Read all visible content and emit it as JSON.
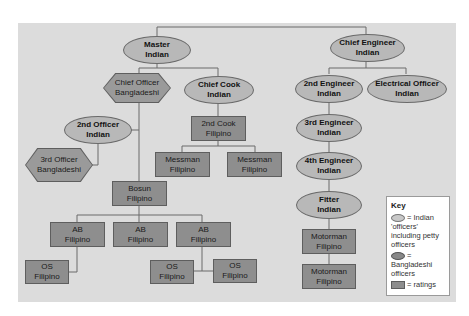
{
  "diagram": {
    "type": "organization-chart",
    "nodes": {
      "master": {
        "role": "Master",
        "nationality": "Indian",
        "shape": "oval"
      },
      "chief_engineer": {
        "role": "Chief Engineer",
        "nationality": "Indian",
        "shape": "oval"
      },
      "chief_officer": {
        "role": "Chief Officer",
        "nationality": "Bangladeshi",
        "shape": "hexagon"
      },
      "chief_cook": {
        "role": "Chief Cook",
        "nationality": "Indian",
        "shape": "oval"
      },
      "second_officer": {
        "role": "2nd  Officer",
        "nationality": "Indian",
        "shape": "oval"
      },
      "third_officer": {
        "role": "3rd Officer",
        "nationality": "Bangladeshi",
        "shape": "hexagon"
      },
      "second_cook": {
        "role": "2nd Cook",
        "nationality": "Filipino",
        "shape": "rect"
      },
      "messman_1": {
        "role": "Messman",
        "nationality": "Filipino",
        "shape": "rect"
      },
      "messman_2": {
        "role": "Messman",
        "nationality": "Filipino",
        "shape": "rect"
      },
      "bosun": {
        "role": "Bosun",
        "nationality": "Filipino",
        "shape": "rect"
      },
      "ab_1": {
        "role": "AB",
        "nationality": "Filipino",
        "shape": "rect"
      },
      "ab_2": {
        "role": "AB",
        "nationality": "Filipino",
        "shape": "rect"
      },
      "ab_3": {
        "role": "AB",
        "nationality": "Filipino",
        "shape": "rect"
      },
      "os_1": {
        "role": "OS",
        "nationality": "Filipino",
        "shape": "rect"
      },
      "os_2": {
        "role": "OS",
        "nationality": "Filipino",
        "shape": "rect"
      },
      "os_3": {
        "role": "OS",
        "nationality": "Filipino",
        "shape": "rect"
      },
      "second_engineer": {
        "role": "2nd  Engineer",
        "nationality": "Indian",
        "shape": "oval"
      },
      "electrical_officer": {
        "role": "Electrical Officer",
        "nationality": "Indian",
        "shape": "oval"
      },
      "third_engineer": {
        "role": "3rd  Engineer",
        "nationality": "Indian",
        "shape": "oval"
      },
      "fourth_engineer": {
        "role": "4th  Engineer",
        "nationality": "Indian",
        "shape": "oval"
      },
      "fitter": {
        "role": "Fitter",
        "nationality": "Indian",
        "shape": "oval"
      },
      "motorman_1": {
        "role": "Motorman",
        "nationality": "Filipino",
        "shape": "rect"
      },
      "motorman_2": {
        "role": "Motorman",
        "nationality": "Filipino",
        "shape": "rect"
      }
    },
    "edges": [
      [
        "master",
        "chief_engineer"
      ],
      [
        "master",
        "chief_officer"
      ],
      [
        "master",
        "chief_cook"
      ],
      [
        "chief_officer",
        "second_officer"
      ],
      [
        "second_officer",
        "third_officer"
      ],
      [
        "chief_officer",
        "bosun"
      ],
      [
        "chief_cook",
        "second_cook"
      ],
      [
        "second_cook",
        "messman_1"
      ],
      [
        "second_cook",
        "messman_2"
      ],
      [
        "bosun",
        "ab_1"
      ],
      [
        "bosun",
        "ab_2"
      ],
      [
        "bosun",
        "ab_3"
      ],
      [
        "ab_1",
        "os_1"
      ],
      [
        "ab_3",
        "os_2"
      ],
      [
        "ab_3",
        "os_3"
      ],
      [
        "chief_engineer",
        "second_engineer"
      ],
      [
        "chief_engineer",
        "electrical_officer"
      ],
      [
        "second_engineer",
        "third_engineer"
      ],
      [
        "third_engineer",
        "fourth_engineer"
      ],
      [
        "fourth_engineer",
        "fitter"
      ],
      [
        "fitter",
        "motorman_1"
      ],
      [
        "motorman_1",
        "motorman_2"
      ]
    ]
  },
  "key": {
    "title": "Key",
    "items": [
      {
        "symbol": "light-oval",
        "label": "= Indian 'officers' including petty officers"
      },
      {
        "symbol": "dark-oval",
        "label": "= Bangladeshi officers"
      },
      {
        "symbol": "rect",
        "label": "= ratings"
      }
    ]
  },
  "colors": {
    "background": "#dcdcdc",
    "oval_fill": "#b8b8b8",
    "rect_fill": "#8e8e8e",
    "hex_fill": "#9a9a9a",
    "line": "#6a6a6a"
  }
}
